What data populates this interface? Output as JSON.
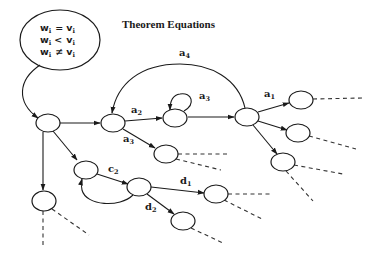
{
  "title": "Theorem Equations",
  "equations": [
    {
      "lhs": "w",
      "lhs_sub": "i",
      "op": "=",
      "rhs": "v",
      "rhs_sub": "i"
    },
    {
      "lhs": "w",
      "lhs_sub": "i",
      "op": "<",
      "rhs": "v",
      "rhs_sub": "i"
    },
    {
      "lhs": "w",
      "lhs_sub": "i",
      "op": "≠",
      "rhs": "v",
      "rhs_sub": "i"
    }
  ],
  "edge_labels": {
    "a1": {
      "base": "a",
      "sub": "1"
    },
    "a2": {
      "base": "a",
      "sub": "2"
    },
    "a3_loop": {
      "base": "a",
      "sub": "3"
    },
    "a3": {
      "base": "a",
      "sub": "3"
    },
    "a4": {
      "base": "a",
      "sub": "4"
    },
    "c2": {
      "base": "c",
      "sub": "2"
    },
    "d1": {
      "base": "d",
      "sub": "1"
    },
    "d2": {
      "base": "d",
      "sub": "2"
    }
  }
}
